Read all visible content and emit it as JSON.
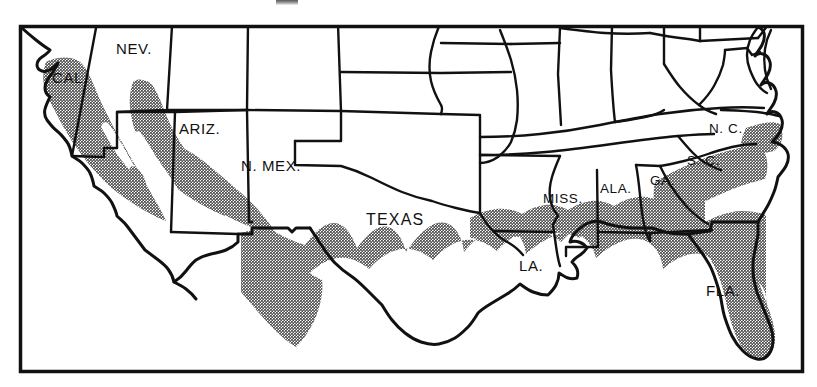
{
  "figure": {
    "type": "thematic-distribution-map",
    "region": "Southern United States",
    "frame": {
      "x": 19,
      "y": 25,
      "width": 784,
      "height": 347
    },
    "colors": {
      "background": "#ffffff",
      "outline": "#111111",
      "shading": "#9a9a9a",
      "frame": "#111111"
    },
    "legend_note": "Shaded area indicates distribution range"
  },
  "labels": [
    {
      "id": "cal",
      "text": "CAL.",
      "x": 52,
      "y": 70,
      "size": "normal"
    },
    {
      "id": "nev",
      "text": "NEV.",
      "x": 116,
      "y": 41,
      "size": "normal"
    },
    {
      "id": "ariz",
      "text": "ARIZ.",
      "x": 179,
      "y": 121,
      "size": "normal"
    },
    {
      "id": "nmex",
      "text": "N. MEX.",
      "x": 241,
      "y": 158,
      "size": "normal"
    },
    {
      "id": "texas",
      "text": "TEXAS",
      "x": 366,
      "y": 212,
      "size": "tx"
    },
    {
      "id": "la",
      "text": "LA.",
      "x": 519,
      "y": 258,
      "size": "normal"
    },
    {
      "id": "miss",
      "text": "MISS.",
      "x": 543,
      "y": 192,
      "size": "sm"
    },
    {
      "id": "ala",
      "text": "ALA.",
      "x": 600,
      "y": 182,
      "size": "sm"
    },
    {
      "id": "ga",
      "text": "GA.",
      "x": 650,
      "y": 174,
      "size": "sm"
    },
    {
      "id": "sc",
      "text": "S. C.",
      "x": 687,
      "y": 154,
      "size": "sm"
    },
    {
      "id": "nc",
      "text": "N. C.",
      "x": 709,
      "y": 122,
      "size": "sm"
    },
    {
      "id": "fla",
      "text": "FLA.",
      "x": 706,
      "y": 283,
      "size": "normal"
    }
  ]
}
